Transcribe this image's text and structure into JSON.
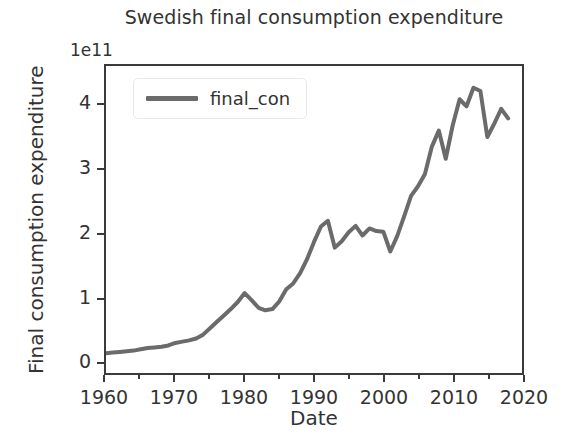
{
  "chart_data": {
    "type": "line",
    "title": "Swedish final consumption expenditure",
    "xlabel": "Date",
    "ylabel": "Final consumption expenditure",
    "offset_text": "1e11",
    "y_scale": 100000000000.0,
    "xlim": [
      1960,
      2020
    ],
    "ylim": [
      -0.18,
      4.62
    ],
    "grid": false,
    "legend_position": "upper left",
    "xticks": [
      1960,
      1970,
      1980,
      1990,
      2000,
      2010,
      2020
    ],
    "xtick_labels": [
      "1960",
      "1970",
      "1980",
      "1990",
      "2000",
      "2010",
      "2020"
    ],
    "xminor_ticks": [
      1965,
      1975,
      1985,
      1995,
      2005,
      2015
    ],
    "yticks": [
      0,
      1,
      2,
      3,
      4
    ],
    "ytick_labels": [
      "0",
      "1",
      "2",
      "3",
      "4"
    ],
    "line_color": "#6b6b6b",
    "line_width": 4,
    "series": [
      {
        "name": "final_con",
        "x": [
          1960,
          1961,
          1962,
          1963,
          1964,
          1965,
          1966,
          1967,
          1968,
          1969,
          1970,
          1971,
          1972,
          1973,
          1974,
          1975,
          1976,
          1977,
          1978,
          1979,
          1980,
          1981,
          1982,
          1983,
          1984,
          1985,
          1986,
          1987,
          1988,
          1989,
          1990,
          1991,
          1992,
          1993,
          1994,
          1995,
          1996,
          1997,
          1998,
          1999,
          2000,
          2001,
          2002,
          2003,
          2004,
          2005,
          2006,
          2007,
          2008,
          2009,
          2010,
          2011,
          2012,
          2013,
          2014,
          2015,
          2016,
          2017,
          2018
        ],
        "values": [
          0.13,
          0.14,
          0.15,
          0.16,
          0.17,
          0.19,
          0.21,
          0.22,
          0.23,
          0.25,
          0.29,
          0.31,
          0.33,
          0.36,
          0.42,
          0.52,
          0.62,
          0.72,
          0.82,
          0.93,
          1.07,
          0.96,
          0.84,
          0.8,
          0.82,
          0.94,
          1.13,
          1.22,
          1.38,
          1.6,
          1.87,
          2.11,
          2.2,
          1.78,
          1.88,
          2.02,
          2.12,
          1.97,
          2.08,
          2.04,
          2.03,
          1.72,
          1.96,
          2.27,
          2.59,
          2.74,
          2.93,
          3.36,
          3.61,
          3.17,
          3.69,
          4.1,
          3.99,
          4.28,
          4.23,
          3.51,
          3.72,
          3.95,
          3.8
        ]
      }
    ]
  },
  "legend": {
    "entries": [
      {
        "label": "final_con",
        "color": "#6b6b6b"
      }
    ]
  }
}
